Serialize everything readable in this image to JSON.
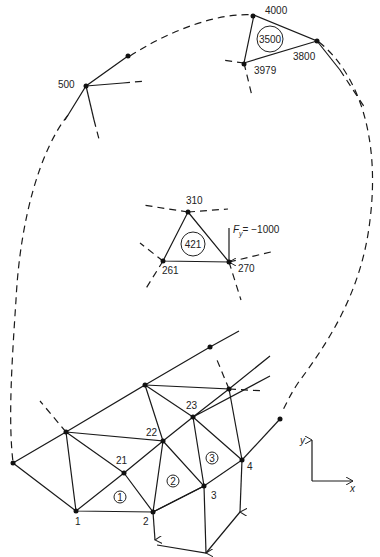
{
  "diagram": {
    "type": "finite-element-mesh",
    "top_element": {
      "id": "3500",
      "nodes": [
        "4000",
        "3800",
        "3979"
      ]
    },
    "isolated_node_label": "500",
    "middle_element": {
      "id": "421",
      "nodes": [
        "310",
        "270",
        "261"
      ],
      "load_label": "F",
      "load_subscript": "y",
      "load_value": "= −1000"
    },
    "bottom_nodes": [
      "1",
      "2",
      "3",
      "4",
      "21",
      "22",
      "23"
    ],
    "bottom_elements": [
      "1",
      "2",
      "3"
    ],
    "axes": {
      "x_label": "x",
      "y_label": "y"
    }
  }
}
